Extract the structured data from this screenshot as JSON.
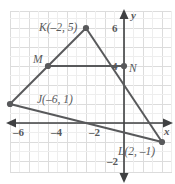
{
  "figure": {
    "type": "coordinate-plane-geometry",
    "axis_labels": {
      "x": "x",
      "y": "y"
    },
    "x_ticks": [
      {
        "value": -6,
        "label": "–6"
      },
      {
        "value": -4,
        "label": "–4"
      },
      {
        "value": -2,
        "label": "–2"
      }
    ],
    "y_ticks": [
      {
        "value": 6,
        "label": "6"
      },
      {
        "value": 4,
        "label": "4"
      },
      {
        "value": -2,
        "label": "–2"
      }
    ],
    "points": [
      {
        "name": "K",
        "label": "K(–2, 5)",
        "x": -2,
        "y": 5
      },
      {
        "name": "M",
        "label": "M",
        "x": -4,
        "y": 3
      },
      {
        "name": "N",
        "label": "N",
        "x": 0,
        "y": 3
      },
      {
        "name": "J",
        "label": "J(–6, 1)",
        "x": -6,
        "y": 1
      },
      {
        "name": "L",
        "label": "L(2, –1)",
        "x": 2,
        "y": -1
      }
    ],
    "segments": [
      {
        "name": "JK",
        "from": "J",
        "to": "K"
      },
      {
        "name": "KL",
        "from": "K",
        "to": "L"
      },
      {
        "name": "JL",
        "from": "J",
        "to": "L"
      },
      {
        "name": "MN",
        "from": "M",
        "to": "N"
      }
    ],
    "colors": {
      "line": "#58595b",
      "grid": "#d8d8d8",
      "axis": "#3f4042",
      "background": "#ffffff",
      "text": "#58595b"
    },
    "grid": {
      "spacing_units": 0.5,
      "visible": true
    }
  }
}
